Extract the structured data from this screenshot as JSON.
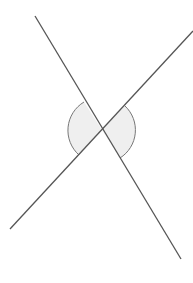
{
  "diagram": {
    "colors": {
      "background": "#ffffff",
      "line": "#555555",
      "arc_fill": "#efefef",
      "arc_stroke": "#777777"
    },
    "intersection": {
      "x": 102,
      "y": 130
    },
    "lines": [
      {
        "name": "line-a",
        "x1": 35,
        "y1": 16,
        "x2": 181,
        "y2": 259
      },
      {
        "name": "line-b",
        "x1": 10,
        "y1": 229,
        "x2": 193,
        "y2": 31
      }
    ],
    "angle_marks": [
      {
        "name": "left-angle-mark",
        "radius": 33,
        "side": "left"
      },
      {
        "name": "right-angle-mark",
        "radius": 33,
        "side": "right"
      }
    ]
  }
}
